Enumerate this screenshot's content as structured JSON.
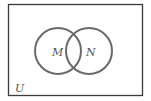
{
  "diagram": {
    "type": "venn",
    "universe": {
      "label": "U"
    },
    "sets": [
      {
        "label": "M"
      },
      {
        "label": "N"
      }
    ],
    "colors": {
      "border": "#3a3a3a",
      "circle": "#666666",
      "text": "#555555"
    }
  }
}
